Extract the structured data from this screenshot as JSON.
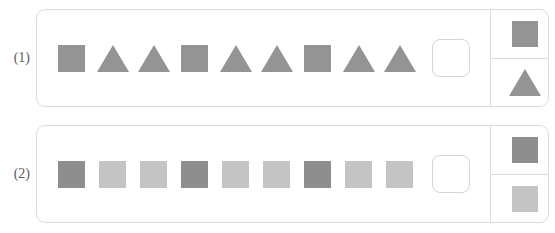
{
  "colors": {
    "shape_medium_gray": "#949494",
    "shape_dark_gray": "#8e8e8e",
    "shape_light_gray": "#c4c4c4",
    "card_border": "#dcdcdc",
    "label_text": "#5c5c5c",
    "page_background": "#ffffff"
  },
  "problems": [
    {
      "label": "(1)",
      "sequence": [
        {
          "shape": "square",
          "color": "#949494"
        },
        {
          "shape": "triangle",
          "color": "#949494"
        },
        {
          "shape": "triangle",
          "color": "#949494"
        },
        {
          "shape": "square",
          "color": "#949494"
        },
        {
          "shape": "triangle",
          "color": "#949494"
        },
        {
          "shape": "triangle",
          "color": "#949494"
        },
        {
          "shape": "square",
          "color": "#949494"
        },
        {
          "shape": "triangle",
          "color": "#949494"
        },
        {
          "shape": "triangle",
          "color": "#949494"
        }
      ],
      "blank": {
        "shape": "empty",
        "color": "#ffffff"
      },
      "options": [
        {
          "shape": "square",
          "color": "#949494"
        },
        {
          "shape": "triangle",
          "color": "#949494"
        }
      ]
    },
    {
      "label": "(2)",
      "sequence": [
        {
          "shape": "square",
          "color": "#8e8e8e"
        },
        {
          "shape": "square",
          "color": "#c4c4c4"
        },
        {
          "shape": "square",
          "color": "#c4c4c4"
        },
        {
          "shape": "square",
          "color": "#8e8e8e"
        },
        {
          "shape": "square",
          "color": "#c4c4c4"
        },
        {
          "shape": "square",
          "color": "#c4c4c4"
        },
        {
          "shape": "square",
          "color": "#8e8e8e"
        },
        {
          "shape": "square",
          "color": "#c4c4c4"
        },
        {
          "shape": "square",
          "color": "#c4c4c4"
        }
      ],
      "blank": {
        "shape": "empty",
        "color": "#ffffff"
      },
      "options": [
        {
          "shape": "square",
          "color": "#8e8e8e"
        },
        {
          "shape": "square",
          "color": "#c4c4c4"
        }
      ]
    }
  ]
}
